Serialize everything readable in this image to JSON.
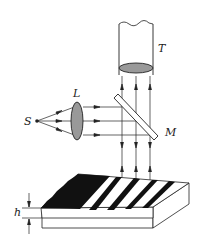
{
  "diagram": {
    "type": "optical-interference-setup",
    "labels": {
      "telescope": "T",
      "lens": "L",
      "source": "S",
      "mirror": "M",
      "thickness": "h"
    },
    "colors": {
      "stroke": "#222222",
      "lens_fill": "#999999",
      "fringe_dark": "#111111",
      "background": "#ffffff"
    },
    "components": [
      {
        "id": "source",
        "label": "S",
        "kind": "point light source"
      },
      {
        "id": "lens",
        "label": "L",
        "kind": "converging lens"
      },
      {
        "id": "mirror",
        "label": "M",
        "kind": "half-silvered plate at 45°"
      },
      {
        "id": "telescope",
        "label": "T",
        "kind": "viewing microscope/telescope"
      },
      {
        "id": "wedge",
        "label": "h",
        "kind": "air wedge with dark/bright fringes"
      }
    ]
  }
}
